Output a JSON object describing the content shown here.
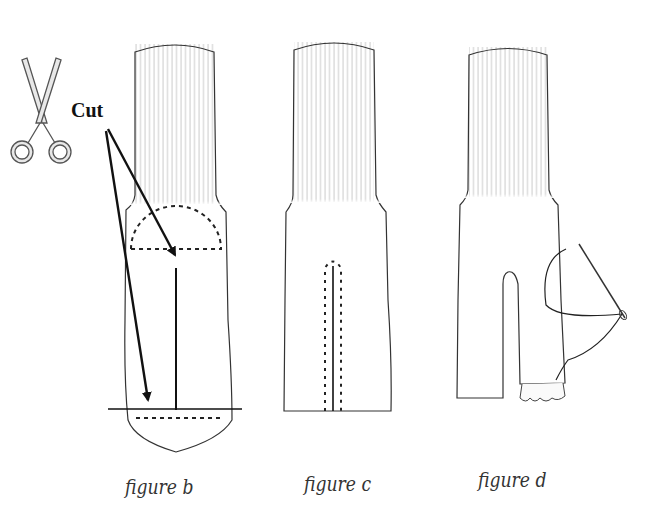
{
  "annotation": {
    "cut_label": "Cut"
  },
  "figures": [
    {
      "id": "b",
      "caption": "figure b"
    },
    {
      "id": "c",
      "caption": "figure c"
    },
    {
      "id": "d",
      "caption": "figure d"
    }
  ],
  "icons": [
    "scissors-icon",
    "needle-icon"
  ],
  "colors": {
    "outline": "#333333",
    "ribbing": "#bbbbbb",
    "arrow": "#111111",
    "background": "#ffffff"
  }
}
